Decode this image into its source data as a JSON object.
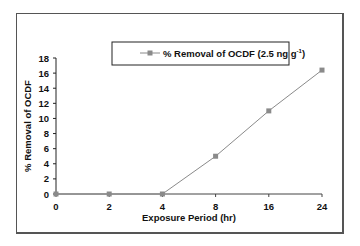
{
  "chart_data": {
    "type": "line",
    "title": "",
    "xlabel": "Exposure Period (hr)",
    "ylabel": "% Removal of OCDF",
    "categories": [
      "0",
      "2",
      "4",
      "8",
      "16",
      "24"
    ],
    "series": [
      {
        "name": "% Removal of OCDF (2.5 ng g-1)",
        "values": [
          0,
          0,
          0,
          5,
          11,
          16.4
        ],
        "color": "#8a8a8a"
      }
    ],
    "ylim": [
      0,
      18
    ],
    "yticks": [
      0,
      2,
      4,
      6,
      8,
      10,
      12,
      14,
      16,
      18
    ],
    "grid": false,
    "legend_position": "top"
  },
  "legend": {
    "label_main": "% Removal of OCDF (2.5 ng g",
    "label_sup": "-1",
    "label_end": ")"
  }
}
